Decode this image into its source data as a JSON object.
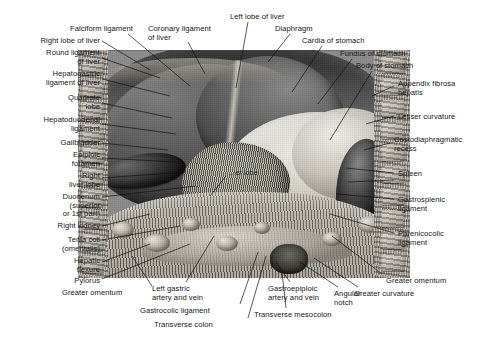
{
  "figure": {
    "plate_labels": [
      {
        "id": "caudate-lobe",
        "text": "...er lobe",
        "x": 229,
        "y": 168
      }
    ],
    "labels_left": [
      {
        "id": "right-lobe-of-liver",
        "text": "Right lobe of liver",
        "x": 8,
        "y": 37,
        "align": "right",
        "w": 92
      },
      {
        "id": "round-ligament-of-liver",
        "text": "Round ligament\nof liver",
        "x": 8,
        "y": 49,
        "align": "right",
        "w": 92
      },
      {
        "id": "hepatogastric-ligament",
        "text": "Hepatogastric\nligament of liver",
        "x": 2,
        "y": 70,
        "align": "right",
        "w": 98
      },
      {
        "id": "quadrate-lobe",
        "text": "Quadrate\nlobe",
        "x": 20,
        "y": 94,
        "align": "right",
        "w": 80
      },
      {
        "id": "hepatoduodenal-ligament",
        "text": "Hepatoduodenal\nligament",
        "x": 6,
        "y": 116,
        "align": "right",
        "w": 94
      },
      {
        "id": "gallbladder",
        "text": "Gallbladder",
        "x": 20,
        "y": 139,
        "align": "right",
        "w": 80
      },
      {
        "id": "epiploic-foramen",
        "text": "Epiploic\nforamen",
        "x": 26,
        "y": 151,
        "align": "right",
        "w": 74
      },
      {
        "id": "right-liver-lobe",
        "text": "Right\nliver lobe",
        "x": 26,
        "y": 172,
        "align": "right",
        "w": 74
      },
      {
        "id": "duodenum",
        "text": "Duodenum\n(superior\nor 1st part)",
        "x": 20,
        "y": 193,
        "align": "right",
        "w": 80
      },
      {
        "id": "right-kidney",
        "text": "Right kidney",
        "x": 18,
        "y": 222,
        "align": "right",
        "w": 82
      },
      {
        "id": "tenia-coli-omentalis",
        "text": "Tenia coli\n(omentalis)",
        "x": 26,
        "y": 236,
        "align": "right",
        "w": 74
      },
      {
        "id": "hepatic-flexure",
        "text": "Hepatic\nflexure",
        "x": 30,
        "y": 257,
        "align": "right",
        "w": 70
      },
      {
        "id": "pylorus",
        "text": "Pylorus",
        "x": 34,
        "y": 277,
        "align": "right",
        "w": 66
      }
    ],
    "labels_top": [
      {
        "id": "falciform-ligament",
        "text": "Falciform ligament",
        "x": 70,
        "y": 25,
        "align": "left",
        "w": 92
      },
      {
        "id": "coronary-ligament",
        "text": "Coronary ligament\nof liver",
        "x": 148,
        "y": 25,
        "align": "left",
        "w": 86
      },
      {
        "id": "left-lobe-of-liver",
        "text": "Left lobe of liver",
        "x": 230,
        "y": 13,
        "align": "left",
        "w": 82
      },
      {
        "id": "diaphragm",
        "text": "Diaphragm",
        "x": 275,
        "y": 25,
        "align": "left",
        "w": 58
      },
      {
        "id": "cardia-of-stomach",
        "text": "Cardia of stomach",
        "x": 302,
        "y": 37,
        "align": "left",
        "w": 88
      },
      {
        "id": "fundus-of-stomach",
        "text": "Fundus of stomach",
        "x": 340,
        "y": 50,
        "align": "left",
        "w": 92
      },
      {
        "id": "body-of-stomach",
        "text": "Body of stomach",
        "x": 356,
        "y": 62,
        "align": "left",
        "w": 84
      }
    ],
    "labels_right": [
      {
        "id": "appendix-fibrosa-hepatis",
        "text": "Appendix fibrosa\nhepatis",
        "x": 398,
        "y": 80,
        "align": "left",
        "w": 88
      },
      {
        "id": "lesser-curvature",
        "text": "Lesser curvature",
        "x": 398,
        "y": 113,
        "align": "left",
        "w": 88
      },
      {
        "id": "costodiaphragmatic-recess",
        "text": "Costodiaphragmatic\nrecess",
        "x": 394,
        "y": 136,
        "align": "left",
        "w": 92
      },
      {
        "id": "spleen",
        "text": "Spleen",
        "x": 398,
        "y": 170,
        "align": "left",
        "w": 88
      },
      {
        "id": "gastrosplenic-ligament",
        "text": "Gastrosplenic\nligament",
        "x": 398,
        "y": 196,
        "align": "left",
        "w": 88
      },
      {
        "id": "phrenicocolic-ligament",
        "text": "Phrenicocolic\nligament",
        "x": 398,
        "y": 230,
        "align": "left",
        "w": 88
      },
      {
        "id": "greater-omentum-right",
        "text": "Greater omentum",
        "x": 386,
        "y": 277,
        "align": "left",
        "w": 96
      }
    ],
    "labels_bottom": [
      {
        "id": "greater-omentum-left",
        "text": "Greater omentum",
        "x": 62,
        "y": 289,
        "align": "left",
        "w": 92
      },
      {
        "id": "left-gastric-artery-vein",
        "text": "Left gastric\nartery and vein",
        "x": 152,
        "y": 285,
        "align": "left",
        "w": 80
      },
      {
        "id": "gastrocolic-ligament",
        "text": "Gastrocolic ligament",
        "x": 140,
        "y": 307,
        "align": "left",
        "w": 104
      },
      {
        "id": "transverse-colon",
        "text": "Transverse colon",
        "x": 154,
        "y": 321,
        "align": "left",
        "w": 88
      },
      {
        "id": "gastroepiploic-artery-vein",
        "text": "Gastroepiploic\nartery and vein",
        "x": 268,
        "y": 285,
        "align": "left",
        "w": 84
      },
      {
        "id": "angular-notch",
        "text": "Angular\nnotch",
        "x": 334,
        "y": 290,
        "align": "left",
        "w": 44
      },
      {
        "id": "greater-curvature",
        "text": "Greater curvature",
        "x": 354,
        "y": 290,
        "align": "left",
        "w": 90
      },
      {
        "id": "transverse-mesocolon",
        "text": "Transverse mesocolon",
        "x": 254,
        "y": 311,
        "align": "left",
        "w": 110
      }
    ],
    "leaders": [
      {
        "id": "l-right-lobe-of-liver",
        "x1": 102,
        "y1": 41,
        "x2": 150,
        "y2": 70
      },
      {
        "id": "l-round-ligament",
        "x1": 102,
        "y1": 58,
        "x2": 160,
        "y2": 78
      },
      {
        "id": "l-hepatogastric",
        "x1": 102,
        "y1": 79,
        "x2": 170,
        "y2": 96
      },
      {
        "id": "l-quadrate-lobe",
        "x1": 102,
        "y1": 103,
        "x2": 172,
        "y2": 118
      },
      {
        "id": "l-hepatoduodenal",
        "x1": 102,
        "y1": 124,
        "x2": 176,
        "y2": 134
      },
      {
        "id": "l-gallbladder",
        "x1": 102,
        "y1": 143,
        "x2": 168,
        "y2": 150
      },
      {
        "id": "l-epiploic-foramen",
        "x1": 102,
        "y1": 158,
        "x2": 176,
        "y2": 162
      },
      {
        "id": "l-right-liver-lobe",
        "x1": 102,
        "y1": 178,
        "x2": 186,
        "y2": 172
      },
      {
        "id": "l-duodenum",
        "x1": 102,
        "y1": 197,
        "x2": 196,
        "y2": 186
      },
      {
        "id": "l-right-kidney",
        "x1": 102,
        "y1": 226,
        "x2": 150,
        "y2": 214
      },
      {
        "id": "l-tenia-coli",
        "x1": 102,
        "y1": 240,
        "x2": 180,
        "y2": 226
      },
      {
        "id": "l-hepatic-flexure",
        "x1": 102,
        "y1": 262,
        "x2": 150,
        "y2": 244
      },
      {
        "id": "l-pylorus",
        "x1": 102,
        "y1": 279,
        "x2": 190,
        "y2": 244
      },
      {
        "id": "l-falciform",
        "x1": 128,
        "y1": 34,
        "x2": 190,
        "y2": 86
      },
      {
        "id": "l-coronary",
        "x1": 188,
        "y1": 42,
        "x2": 205,
        "y2": 74
      },
      {
        "id": "l-left-lobe",
        "x1": 248,
        "y1": 22,
        "x2": 236,
        "y2": 88
      },
      {
        "id": "l-diaphragm",
        "x1": 290,
        "y1": 34,
        "x2": 268,
        "y2": 62
      },
      {
        "id": "l-cardia",
        "x1": 322,
        "y1": 46,
        "x2": 292,
        "y2": 92
      },
      {
        "id": "l-fundus",
        "x1": 352,
        "y1": 59,
        "x2": 318,
        "y2": 104
      },
      {
        "id": "l-body-of-stomach",
        "x1": 372,
        "y1": 71,
        "x2": 330,
        "y2": 140
      },
      {
        "id": "l-appendix-fibrosa",
        "x1": 394,
        "y1": 86,
        "x2": 372,
        "y2": 96
      },
      {
        "id": "l-lesser-curvature",
        "x1": 394,
        "y1": 116,
        "x2": 366,
        "y2": 124
      },
      {
        "id": "l-costodiaphragmatic",
        "x1": 390,
        "y1": 143,
        "x2": 364,
        "y2": 150
      },
      {
        "id": "l-spleen",
        "x1": 394,
        "y1": 173,
        "x2": 346,
        "y2": 168
      },
      {
        "id": "l-spleen-2",
        "x1": 394,
        "y1": 180,
        "x2": 348,
        "y2": 182
      },
      {
        "id": "l-gastrosplenic",
        "x1": 394,
        "y1": 199,
        "x2": 336,
        "y2": 194
      },
      {
        "id": "l-phrenicocolic",
        "x1": 394,
        "y1": 233,
        "x2": 330,
        "y2": 214
      },
      {
        "id": "l-greater-omentum-right",
        "x1": 382,
        "y1": 274,
        "x2": 332,
        "y2": 236
      },
      {
        "id": "l-greater-omentum-left",
        "x1": 152,
        "y1": 286,
        "x2": 132,
        "y2": 256
      },
      {
        "id": "l-left-gastric",
        "x1": 186,
        "y1": 282,
        "x2": 214,
        "y2": 236
      },
      {
        "id": "l-gastrocolic",
        "x1": 240,
        "y1": 304,
        "x2": 258,
        "y2": 252
      },
      {
        "id": "l-transverse-colon",
        "x1": 248,
        "y1": 318,
        "x2": 266,
        "y2": 256
      },
      {
        "id": "l-gastroepiploic",
        "x1": 290,
        "y1": 282,
        "x2": 276,
        "y2": 262
      },
      {
        "id": "l-angular-notch",
        "x1": 338,
        "y1": 287,
        "x2": 300,
        "y2": 262
      },
      {
        "id": "l-greater-curvature",
        "x1": 358,
        "y1": 287,
        "x2": 314,
        "y2": 258
      },
      {
        "id": "l-transverse-mesocolon",
        "x1": 286,
        "y1": 308,
        "x2": 282,
        "y2": 272
      },
      {
        "id": "l-caudate",
        "x1": 226,
        "y1": 176,
        "x2": 210,
        "y2": 196
      }
    ],
    "ribs_left_y": [
      8,
      30,
      52,
      74,
      96,
      118,
      140,
      162,
      184,
      206
    ],
    "ribs_right_y": [
      6,
      28,
      50,
      72,
      94,
      116,
      138,
      160,
      182,
      204
    ],
    "omentum_fat": [
      {
        "x": 26,
        "y": 30,
        "w": 22,
        "h": 16
      },
      {
        "x": 58,
        "y": 42,
        "w": 26,
        "h": 18
      },
      {
        "x": 96,
        "y": 26,
        "w": 18,
        "h": 13
      },
      {
        "x": 130,
        "y": 44,
        "w": 22,
        "h": 15
      },
      {
        "x": 168,
        "y": 30,
        "w": 16,
        "h": 12
      },
      {
        "x": 236,
        "y": 40,
        "w": 20,
        "h": 14
      },
      {
        "x": 272,
        "y": 24,
        "w": 24,
        "h": 17
      }
    ]
  }
}
